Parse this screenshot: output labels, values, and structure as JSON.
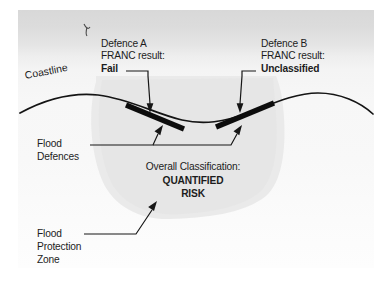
{
  "figure": {
    "background_top": "#d8d8d8",
    "background_bottom": "#fdfdfd",
    "zone_fill": "#ebebeb",
    "ink": "#1c1c1c"
  },
  "labels": {
    "coastline": "Coastline",
    "defence_a": {
      "line1": "Defence A",
      "line2": "FRANC result:",
      "result": "Fail"
    },
    "defence_b": {
      "line1": "Defence B",
      "line2": "FRANC result:",
      "result": "Unclassified"
    },
    "flood_defences": {
      "line1": "Flood",
      "line2": "Defences"
    },
    "flood_protection_zone": {
      "line1": "Flood",
      "line2": "Protection",
      "line3": "Zone"
    },
    "overall": {
      "heading": "Overall Classification:",
      "value_line1": "QUANTIFIED",
      "value_line2": "RISK"
    }
  },
  "icons": {
    "corner_scribble": "scribble-mark-icon",
    "defence_bar_a": "flood-defence-bar-icon",
    "defence_bar_b": "flood-defence-bar-icon",
    "coastline_curve": "coastline-curve-icon",
    "zone_blob": "flood-protection-zone-icon"
  }
}
